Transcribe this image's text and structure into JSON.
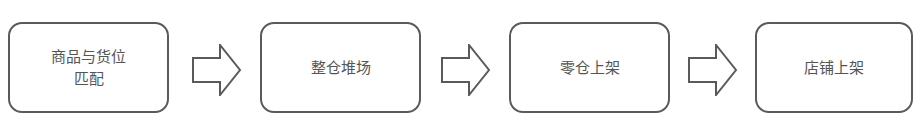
{
  "diagram": {
    "type": "flowchart",
    "direction": "left-to-right",
    "steps": [
      {
        "label_line1": "商品与货位",
        "label_line2": "匹配"
      },
      {
        "label_line1": "整仓堆场"
      },
      {
        "label_line1": "零仓上架"
      },
      {
        "label_line1": "店铺上架"
      }
    ],
    "connector": "hollow-right-arrow",
    "colors": {
      "stroke": "#5a5a5a",
      "text": "#555555",
      "background": "#ffffff"
    }
  }
}
